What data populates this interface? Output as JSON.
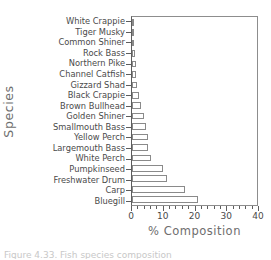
{
  "chart_data": {
    "type": "bar",
    "orientation": "horizontal",
    "title": "",
    "xlabel": "% Composition",
    "ylabel": "Species",
    "xlim": [
      0,
      40
    ],
    "xticks": [
      0,
      10,
      20,
      30,
      40
    ],
    "xtick_labels": [
      "0",
      "10",
      "20",
      "30",
      "40"
    ],
    "minor_tick_step": 2,
    "grid": false,
    "legend": null,
    "categories": [
      "White Crappie",
      "Tiger Musky",
      "Common Shiner",
      "Rock Bass",
      "Northern Pike",
      "Channel Catfish",
      "Gizzard Shad",
      "Black Crappie",
      "Brown Bullhead",
      "Golden Shiner",
      "Smallmouth Bass",
      "Yellow Perch",
      "Largemouth Bass",
      "White Perch",
      "Pumpkinseed",
      "Freshwater Drum",
      "Carp",
      "Bluegill"
    ],
    "values": [
      0.2,
      0.3,
      0.6,
      0.9,
      1.4,
      1.4,
      1.5,
      2.2,
      2.8,
      3.9,
      4.4,
      5.1,
      5.1,
      6.2,
      10.0,
      11.1,
      17.1,
      21.2
    ],
    "bar_fill_color": "#ffffff",
    "bar_edge_color": "#8a8a8a",
    "axis_color": "#5d5d5d",
    "text_color": "#4a4a4a"
  },
  "caption": {
    "text": "Figure 4.33. Fish species composition"
  }
}
